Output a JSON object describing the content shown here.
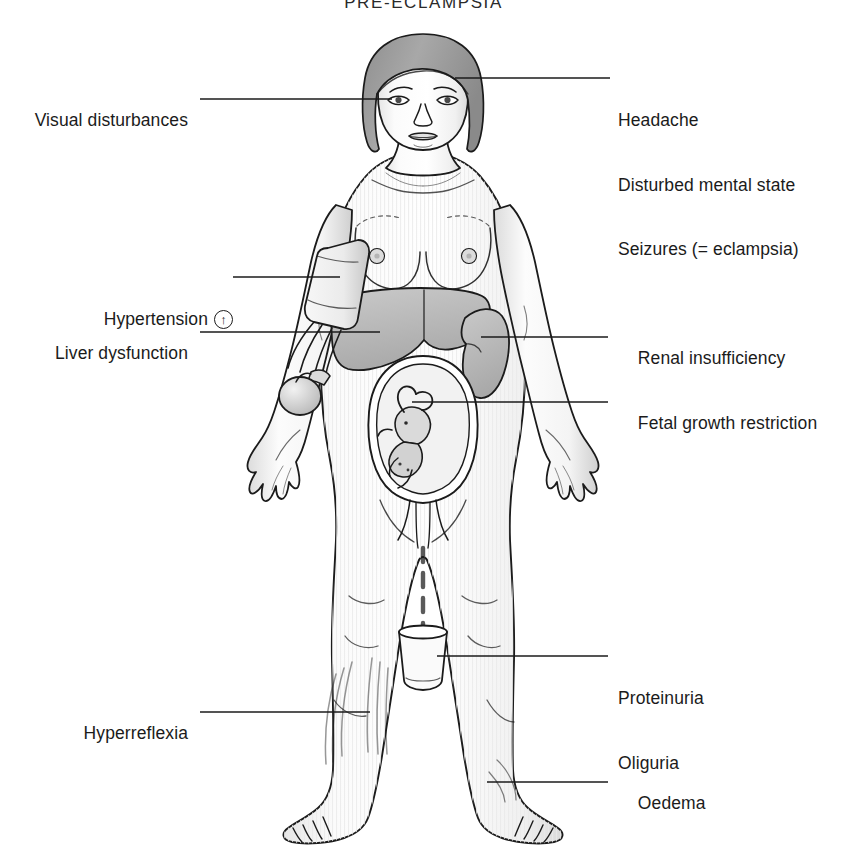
{
  "title": "PRE-ECLAMPSIA",
  "diagram": {
    "background_color": "#ffffff",
    "line_color": "#1b1b1b",
    "skin_fill": "#fdfdfd",
    "organ_fill": "#bdbdbd",
    "hair_fill": "#9a9a9a",
    "shade_fill": "#d6d6d6"
  },
  "labels": {
    "visual_disturbances": {
      "text": "Visual disturbances",
      "side": "left"
    },
    "hypertension": {
      "text": "Hypertension",
      "side": "left",
      "icon": "up-arrow-circle-icon",
      "icon_glyph": "↑"
    },
    "liver_dysfunction": {
      "text": "Liver dysfunction",
      "side": "left"
    },
    "hyperreflexia": {
      "text": "Hyperreflexia",
      "side": "left"
    },
    "headache": {
      "text": "Headache",
      "side": "right"
    },
    "disturbed_mental_state": {
      "text": "Disturbed mental state",
      "side": "right"
    },
    "seizures": {
      "text": "Seizures (= eclampsia)",
      "side": "right"
    },
    "renal_insufficiency": {
      "text": "Renal insufficiency",
      "side": "right"
    },
    "fetal_growth_restriction": {
      "text": "Fetal growth restriction",
      "side": "right"
    },
    "proteinuria": {
      "text": "Proteinuria",
      "side": "right"
    },
    "oliguria": {
      "text": "Oliguria",
      "side": "right"
    },
    "oedema": {
      "text": "Oedema",
      "side": "right"
    }
  },
  "annotated_parts": {
    "eye": "visual-disturbances-target",
    "forehead": "headache-target",
    "bp_cuff": "hypertension-target",
    "liver": "liver-dysfunction-target",
    "kidney": "renal-insufficiency-target",
    "fetus": "fetal-growth-restriction-target",
    "urine_beaker": "proteinuria-oliguria-target",
    "left_calf_motion": "hyperreflexia-target",
    "right_ankle_swelling": "oedema-target"
  }
}
